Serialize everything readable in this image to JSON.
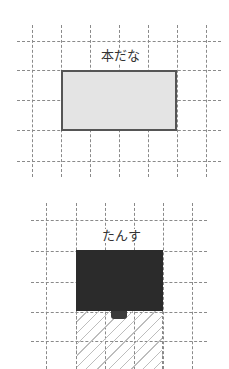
{
  "diagrams": [
    {
      "label": "本だな",
      "object": "bookshelf",
      "fill": "#e4e4e4",
      "border": "#555555",
      "grid": {
        "vertical_x": [
          32,
          61,
          90,
          119,
          148,
          177,
          206
        ],
        "horizontal_y": [
          41,
          70,
          100,
          130,
          161
        ]
      }
    },
    {
      "label": "たんす",
      "object": "chest-of-drawers",
      "fill": "#2b2b2b",
      "hatch_color": "#bdbdbd",
      "grid": {
        "vertical_x": [
          46,
          76,
          105,
          134,
          163,
          192
        ],
        "horizontal_y": [
          220,
          251,
          282,
          312,
          341
        ]
      }
    }
  ]
}
